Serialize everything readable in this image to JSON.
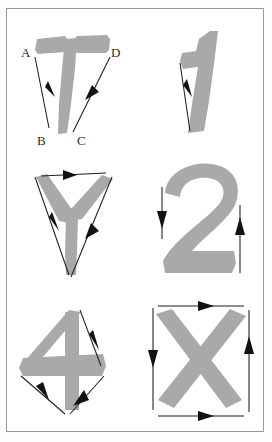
{
  "figure": {
    "kind": "stroke-direction-diagram",
    "frame": {
      "border_color": "#9a9a9a",
      "background": "#ffffff"
    },
    "glyph_color": "#a9a9a9",
    "arrow_color": "#121212",
    "label_color": "#2b2b2b",
    "grid": {
      "rows": 3,
      "columns": 2
    },
    "cells": [
      {
        "id": "cell-t",
        "character": "T",
        "row": 1,
        "column": 1,
        "labels": [
          {
            "text": "A",
            "position": "top-left"
          },
          {
            "text": "D",
            "position": "top-right"
          },
          {
            "text": "B",
            "position": "bottom-left"
          },
          {
            "text": "C",
            "position": "bottom-right"
          }
        ],
        "arrows": [
          {
            "name": "arrow-a-to-b",
            "from": "A",
            "to": "B",
            "direction": "down-left"
          },
          {
            "name": "arrow-c-to-d",
            "from": "C",
            "to": "D",
            "direction": "up-right"
          }
        ],
        "arrow_count": 2
      },
      {
        "id": "cell-one",
        "character": "1",
        "row": 1,
        "column": 2,
        "labels": [],
        "arrows": [
          {
            "name": "arrow-down",
            "from": "",
            "to": "",
            "direction": "down"
          }
        ],
        "arrow_count": 1
      },
      {
        "id": "cell-y",
        "character": "Y",
        "row": 2,
        "column": 1,
        "labels": [],
        "arrows": [
          {
            "name": "arrow-top-left",
            "from": "",
            "to": "",
            "direction": "left"
          },
          {
            "name": "arrow-left-down",
            "from": "",
            "to": "",
            "direction": "down"
          },
          {
            "name": "arrow-right-up",
            "from": "",
            "to": "",
            "direction": "up"
          }
        ],
        "arrow_count": 3
      },
      {
        "id": "cell-two",
        "character": "2",
        "row": 2,
        "column": 2,
        "labels": [],
        "arrows": [
          {
            "name": "arrow-left-down",
            "from": "",
            "to": "",
            "direction": "down"
          },
          {
            "name": "arrow-right-up",
            "from": "",
            "to": "",
            "direction": "up"
          }
        ],
        "arrow_count": 2
      },
      {
        "id": "cell-four",
        "character": "4",
        "row": 3,
        "column": 1,
        "labels": [],
        "arrows": [
          {
            "name": "arrow-top-down-right",
            "from": "",
            "to": "",
            "direction": "down-right"
          },
          {
            "name": "arrow-left-down-right",
            "from": "",
            "to": "",
            "direction": "down-right"
          },
          {
            "name": "arrow-bottom-up-right",
            "from": "",
            "to": "",
            "direction": "up-right"
          }
        ],
        "arrow_count": 3
      },
      {
        "id": "cell-x",
        "character": "X",
        "row": 3,
        "column": 2,
        "labels": [],
        "arrows": [
          {
            "name": "arrow-top-right",
            "from": "",
            "to": "",
            "direction": "right"
          },
          {
            "name": "arrow-left-down",
            "from": "",
            "to": "",
            "direction": "down"
          },
          {
            "name": "arrow-bottom-right",
            "from": "",
            "to": "",
            "direction": "right"
          },
          {
            "name": "arrow-right-up",
            "from": "",
            "to": "",
            "direction": "up"
          }
        ],
        "arrow_count": 4
      }
    ]
  }
}
